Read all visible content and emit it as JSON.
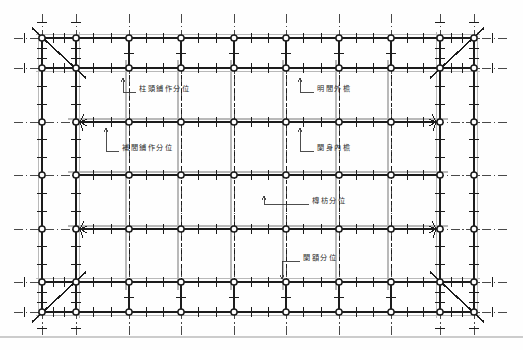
{
  "figure": {
    "kind": "architectural-plan",
    "caption_top": "",
    "background_color": "#fefefe",
    "line_color": "#1c1c1c",
    "ghost_color": "#b9b9b9",
    "node_fill": "#ffffff",
    "width": 523,
    "height": 350
  },
  "labels": [
    {
      "id": "zhutou",
      "text": "柱頭鋪作分位",
      "x": 139,
      "y": 89,
      "leader": {
        "from_x": 136,
        "from_y": 92,
        "to_x": 123,
        "to_y": 92,
        "up_x": 123,
        "up_y": 78
      }
    },
    {
      "id": "mingjian",
      "text": "明間外檐",
      "x": 317,
      "y": 89,
      "leader": {
        "from_x": 314,
        "from_y": 92,
        "to_x": 300,
        "to_y": 92,
        "up_x": 300,
        "up_y": 78
      }
    },
    {
      "id": "bujian",
      "text": "補間鋪作分位",
      "x": 122,
      "y": 148,
      "leader": {
        "from_x": 119,
        "from_y": 151,
        "to_x": 106,
        "to_y": 151,
        "up_x": 106,
        "up_y": 128
      }
    },
    {
      "id": "jianshen",
      "text": "闌身內檐",
      "x": 317,
      "y": 148,
      "leader": {
        "from_x": 314,
        "from_y": 151,
        "to_x": 300,
        "to_y": 151,
        "up_x": 300,
        "up_y": 128
      }
    },
    {
      "id": "tuanfang",
      "text": "槫枋分位",
      "x": 312,
      "y": 201,
      "leader": {
        "from_x": 309,
        "from_y": 204,
        "to_x": 264,
        "to_y": 204,
        "up_x": 264,
        "up_y": 196
      }
    },
    {
      "id": "lan_e",
      "text": "闌額分位",
      "x": 303,
      "y": 258,
      "leader": {
        "from_x": 300,
        "from_y": 261,
        "to_x": 282,
        "to_y": 261,
        "up_x": 282,
        "up_y": 279
      }
    }
  ],
  "grid": {
    "outer_cols_x": [
      42,
      76,
      129,
      181,
      234,
      286,
      339,
      391,
      440,
      474
    ],
    "outer_rows_y": [
      38,
      68,
      122,
      175,
      229,
      282,
      312
    ],
    "ring": {
      "outer_left": 42,
      "inner_left": 76,
      "outer_right": 474,
      "inner_right": 440,
      "outer_top": 38,
      "inner_top": 68,
      "outer_bottom": 312,
      "inner_bottom": 282
    },
    "bay_cols_x": [
      129,
      181,
      234,
      286,
      339,
      391
    ],
    "bay_rows_y": [
      122,
      175,
      229
    ],
    "node_radius": 3.1,
    "tick_len": 5,
    "corner_diagonals": [
      {
        "x1": 32,
        "y1": 28,
        "x2": 86,
        "y2": 78
      },
      {
        "x1": 484,
        "y1": 28,
        "x2": 430,
        "y2": 78
      },
      {
        "x1": 32,
        "y1": 322,
        "x2": 86,
        "y2": 272
      },
      {
        "x1": 484,
        "y1": 322,
        "x2": 430,
        "y2": 272
      }
    ],
    "burst_nodes": [
      {
        "x": 76,
        "y": 122
      },
      {
        "x": 76,
        "y": 229
      },
      {
        "x": 440,
        "y": 122
      },
      {
        "x": 440,
        "y": 229
      }
    ]
  },
  "scan_artifacts": {
    "bottom_rule_y": 337,
    "bottom_rule_color": "#cccccc"
  }
}
